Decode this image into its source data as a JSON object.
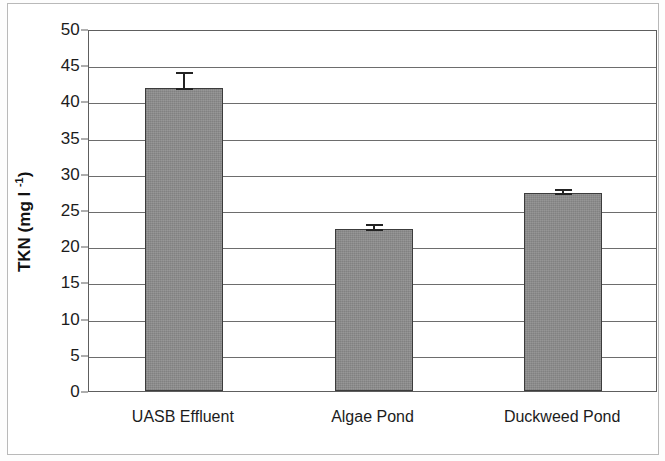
{
  "chart_data": {
    "type": "bar",
    "title": "",
    "xlabel": "",
    "ylabel": "TKN (mg l -1)",
    "ylabel_main": "TKN (mg l ",
    "ylabel_sup": "-1",
    "ylabel_tail": ")",
    "categories": [
      "UASB Effluent",
      "Algae Pond",
      "Duckweed Pond"
    ],
    "values": [
      41.8,
      22.4,
      27.3
    ],
    "errors": [
      2.5,
      1.0,
      0.9
    ],
    "ylim": [
      0,
      50
    ],
    "ytick_labels": [
      "0",
      "5",
      "10",
      "15",
      "20",
      "25",
      "30",
      "35",
      "40",
      "45",
      "50"
    ],
    "ytick_values": [
      0,
      5,
      10,
      15,
      20,
      25,
      30,
      35,
      40,
      45,
      50
    ],
    "grid": true,
    "legend": false,
    "bar_color": "#8c8c8c",
    "bar_edge_color": "#3c3c3c",
    "error_color": "#232323",
    "axis_color": "#5e5e5e",
    "grid_color": "#6d6d6d",
    "background": "#ffffff"
  }
}
